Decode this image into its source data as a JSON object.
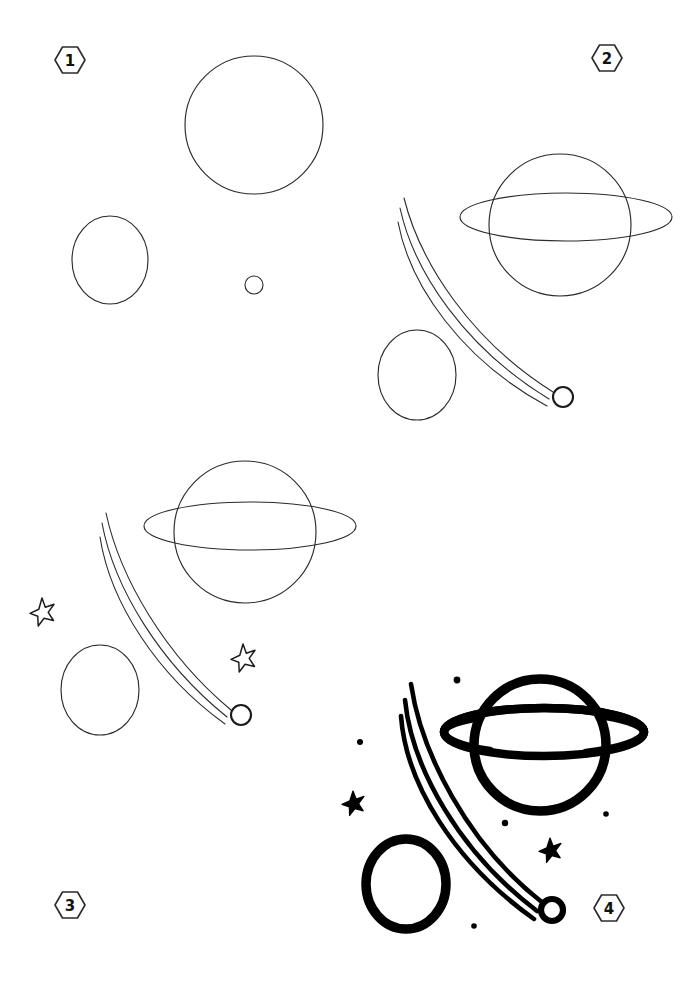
{
  "page": {
    "width": 700,
    "height": 986,
    "background_color": "#ffffff",
    "ink_color": "#1a1a1a",
    "sketch_color": "#2b2b2b"
  },
  "steps": [
    {
      "id": "step-1",
      "number": "1",
      "badge": {
        "x": 70,
        "y": 60
      },
      "description": "Draw a large circle for the planet, an oval for the moon, and a tiny circle for the comet head.",
      "elements": [
        {
          "name": "planet-body-circle",
          "type": "circle",
          "cx": 254,
          "cy": 125,
          "r": 69,
          "style": "thin"
        },
        {
          "name": "moon-oval",
          "type": "ellipse",
          "cx": 110,
          "cy": 260,
          "rx": 38,
          "ry": 44,
          "style": "thin"
        },
        {
          "name": "comet-head-circle",
          "type": "circle",
          "cx": 254,
          "cy": 285,
          "r": 9,
          "style": "thin"
        }
      ]
    },
    {
      "id": "step-2",
      "number": "2",
      "badge": {
        "x": 607,
        "y": 58
      },
      "description": "Add the elliptical ring around the planet and three sweeping comet trail lines.",
      "elements": [
        {
          "name": "planet-body-circle",
          "type": "circle",
          "cx": 560,
          "cy": 225,
          "r": 71,
          "style": "thin"
        },
        {
          "name": "planet-ring-ellipse",
          "type": "ellipse",
          "cx": 566,
          "cy": 217,
          "rx": 106,
          "ry": 24,
          "style": "thin"
        },
        {
          "name": "moon-oval",
          "type": "ellipse",
          "cx": 417,
          "cy": 375,
          "rx": 39,
          "ry": 45,
          "style": "thin"
        },
        {
          "name": "comet-trail-line",
          "type": "path",
          "style": "thin-trail"
        },
        {
          "name": "comet-head-circle",
          "type": "circle",
          "cx": 563,
          "cy": 397,
          "r": 10,
          "style": "thin-comet"
        }
      ]
    },
    {
      "id": "step-3",
      "number": "3",
      "badge": {
        "x": 70,
        "y": 905
      },
      "description": "Add two small outline stars to fill the background space.",
      "elements": [
        {
          "name": "planet-body-circle",
          "type": "circle",
          "cx": 245,
          "cy": 532,
          "r": 71,
          "style": "thin"
        },
        {
          "name": "planet-ring-ellipse",
          "type": "ellipse",
          "cx": 250,
          "cy": 526,
          "rx": 106,
          "ry": 24,
          "style": "thin"
        },
        {
          "name": "moon-oval",
          "type": "ellipse",
          "cx": 100,
          "cy": 690,
          "rx": 39,
          "ry": 45,
          "style": "thin"
        },
        {
          "name": "comet-trail-line",
          "type": "path",
          "style": "thin-trail"
        },
        {
          "name": "comet-head-circle",
          "type": "circle",
          "cx": 241,
          "cy": 715,
          "r": 10,
          "style": "thin-comet"
        },
        {
          "name": "star-outline",
          "type": "star",
          "cx": 42,
          "cy": 610,
          "r": 12,
          "style": "star-outline"
        },
        {
          "name": "star-outline",
          "type": "star",
          "cx": 243,
          "cy": 656,
          "r": 12,
          "style": "star-outline"
        }
      ]
    },
    {
      "id": "step-4",
      "number": "4",
      "badge": {
        "x": 609,
        "y": 908
      },
      "description": "Ink everything with bold strokes, fill in the stars and add small dots.",
      "elements": [
        {
          "name": "planet-body-circle",
          "type": "circle",
          "cx": 540,
          "cy": 745,
          "r": 66,
          "style": "bold"
        },
        {
          "name": "planet-ring-ellipse",
          "type": "ellipse",
          "cx": 544,
          "cy": 732,
          "rx": 100,
          "ry": 24,
          "style": "bold-ring"
        },
        {
          "name": "moon-oval",
          "type": "ellipse",
          "cx": 406,
          "cy": 884,
          "rx": 40,
          "ry": 45,
          "style": "bold"
        },
        {
          "name": "comet-trail-line",
          "type": "path",
          "style": "bold-trail"
        },
        {
          "name": "comet-head-circle",
          "type": "circle",
          "cx": 552,
          "cy": 910,
          "r": 11,
          "style": "bold-comet"
        },
        {
          "name": "star-filled",
          "type": "star",
          "cx": 353,
          "cy": 801,
          "r": 10,
          "style": "star-filled"
        },
        {
          "name": "star-filled",
          "type": "star",
          "cx": 550,
          "cy": 848,
          "r": 10,
          "style": "star-filled"
        },
        {
          "name": "sparkle-dot",
          "type": "dot",
          "cx": 457,
          "cy": 680,
          "r": 3.4
        },
        {
          "name": "sparkle-dot",
          "type": "dot",
          "cx": 360,
          "cy": 742,
          "r": 3.0
        },
        {
          "name": "sparkle-dot",
          "type": "dot",
          "cx": 505,
          "cy": 823,
          "r": 3.2
        },
        {
          "name": "sparkle-dot",
          "type": "dot",
          "cx": 606,
          "cy": 814,
          "r": 2.8
        },
        {
          "name": "sparkle-dot",
          "type": "dot",
          "cx": 474,
          "cy": 926,
          "r": 2.8
        }
      ]
    }
  ]
}
